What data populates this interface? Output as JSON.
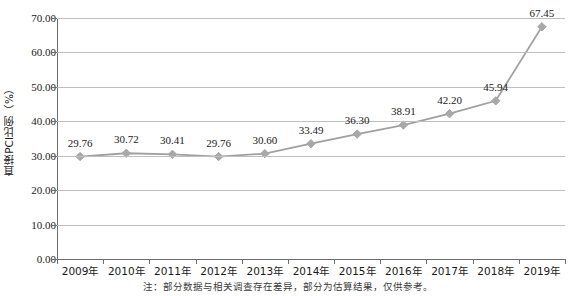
{
  "chart_data": {
    "type": "line",
    "title": "",
    "xlabel": "",
    "ylabel": "直接PCI比例（%）",
    "categories": [
      "2009年",
      "2010年",
      "2011年",
      "2012年",
      "2013年",
      "2014年",
      "2015年",
      "2016年",
      "2017年",
      "2018年",
      "2019年"
    ],
    "values": [
      29.76,
      30.72,
      30.41,
      29.76,
      30.6,
      33.49,
      36.3,
      38.91,
      42.2,
      45.94,
      67.45
    ],
    "data_labels": [
      "29.76",
      "30.72",
      "30.41",
      "29.76",
      "30.60",
      "33.49",
      "36.30",
      "38.91",
      "42.20",
      "45.94",
      "67.45"
    ],
    "ylim": [
      0,
      70
    ],
    "ytick_values": [
      0,
      10,
      20,
      30,
      40,
      50,
      60,
      70
    ],
    "ytick_labels": [
      "0.00",
      "10.00",
      "20.00",
      "30.00",
      "40.00",
      "50.00",
      "60.00",
      "70.00"
    ],
    "grid": true,
    "legend": false,
    "marker": "diamond",
    "series_color": "#a0a0a0",
    "marker_color": "#a8a8a8",
    "grid_color": "#bfbfbf",
    "axis_color": "#6e6e6e",
    "background": "#ffffff"
  },
  "caption": {
    "text": "注：部分数据与相关调查存在差异，部分为估算结果，仅供参考。"
  }
}
